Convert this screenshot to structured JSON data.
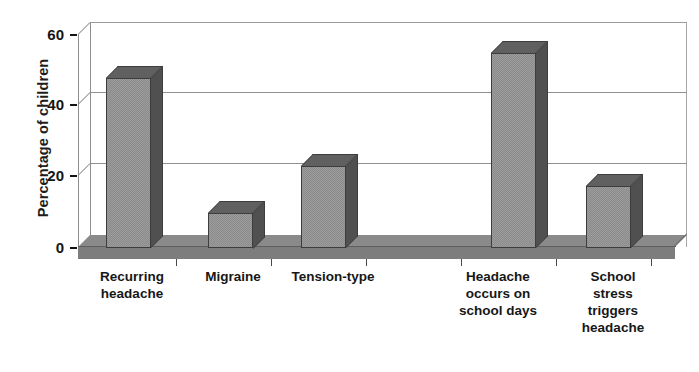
{
  "chart_data": {
    "type": "bar",
    "title": "",
    "subtitle": "",
    "xlabel": "",
    "ylabel": "Percentage of children",
    "ylim": [
      0,
      60
    ],
    "ytick_labels": [
      "0",
      "20",
      "40",
      "60"
    ],
    "ytick_values": [
      0,
      20,
      40,
      60
    ],
    "grid": true,
    "legend": "none",
    "style": "3d-bar-grayscale",
    "categories": [
      "Recurring headache",
      "Migraine",
      "Tension-type",
      "Headache occurs on school days",
      "School stress triggers headache"
    ],
    "values": [
      48,
      10,
      23,
      55,
      17.5
    ],
    "series": [
      {
        "name": "Percentage of children",
        "values": [
          48,
          10,
          23,
          55,
          17.5
        ]
      }
    ]
  },
  "axis": {
    "y_title": "Percentage of children",
    "ticks": [
      {
        "label": "60",
        "value": 60
      },
      {
        "label": "40",
        "value": 40
      },
      {
        "label": "20",
        "value": 20
      },
      {
        "label": "0",
        "value": 0
      }
    ]
  },
  "bars": [
    {
      "name": "recurring-headache",
      "label_lines": [
        "Recurring",
        "headache"
      ],
      "value": 48
    },
    {
      "name": "migraine",
      "label_lines": [
        "Migraine"
      ],
      "value": 10
    },
    {
      "name": "tension-type",
      "label_lines": [
        "Tension-type"
      ],
      "value": 23
    },
    {
      "name": "headache-school-days",
      "label_lines": [
        "Headache",
        "occurs on",
        "school days"
      ],
      "value": 55
    },
    {
      "name": "school-stress",
      "label_lines": [
        "School",
        "stress",
        "triggers",
        "headache"
      ],
      "value": 17.5
    }
  ],
  "labels": {
    "cat1_line1": "Recurring",
    "cat1_line2": "headache",
    "cat2_line1": "Migraine",
    "cat3_line1": "Tension-type",
    "cat4_line1": "Headache",
    "cat4_line2": "occurs on",
    "cat4_line3": "school days",
    "cat5_line1": "School",
    "cat5_line2": "stress",
    "cat5_line3": "triggers",
    "cat5_line4": "headache"
  },
  "colors": {
    "bar_front": "#9d9d9d",
    "bar_side": "#5a5a5a",
    "bar_top": "#6a6a6a",
    "bar_outline": "#3d3d3d",
    "floor": "#7d7d7d",
    "gridline": "#8f8f8f",
    "text": "#171717",
    "background": "#ffffff"
  }
}
